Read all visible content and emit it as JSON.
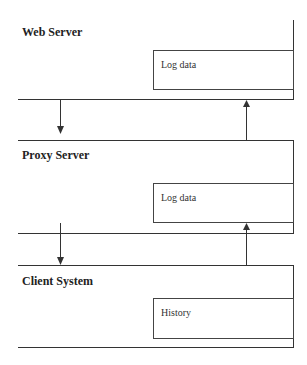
{
  "diagram": {
    "layers": [
      {
        "name": "Web Server",
        "inner_box": "Log data"
      },
      {
        "name": "Proxy Server",
        "inner_box": "Log data"
      },
      {
        "name": "Client System",
        "inner_box": "History"
      }
    ],
    "arrows": [
      {
        "from": "Web Server",
        "to": "Proxy Server",
        "direction": "down"
      },
      {
        "from": "Proxy Server",
        "to": "Web Server",
        "direction": "up"
      },
      {
        "from": "Proxy Server",
        "to": "Client System",
        "direction": "down"
      },
      {
        "from": "Client System",
        "to": "Proxy Server",
        "direction": "up"
      }
    ]
  }
}
